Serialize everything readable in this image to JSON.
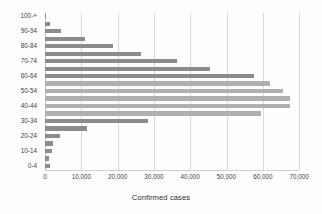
{
  "chart_data": {
    "type": "bar",
    "orientation": "horizontal",
    "title": "",
    "xlabel": "Confirmed cases",
    "ylabel": "",
    "xlim": [
      0,
      70000
    ],
    "ylim": null,
    "grid": true,
    "legend": null,
    "xticks": [
      0,
      10000,
      20000,
      30000,
      40000,
      50000,
      60000,
      70000
    ],
    "xticklabels": [
      "0",
      "10,000",
      "20,000",
      "30,000",
      "40,000",
      "50,000",
      "60,000",
      "70,000"
    ],
    "categories": [
      "100-+",
      "95-99",
      "90-94",
      "85-89",
      "80-84",
      "75-79",
      "70-74",
      "65-69",
      "60-64",
      "55-59",
      "50-54",
      "45-49",
      "40-44",
      "35-39",
      "30-34",
      "25-29",
      "20-24",
      "15-19",
      "10-14",
      "5-9",
      "0-4"
    ],
    "visible_yticklabels": [
      "100-+",
      "90-94",
      "80-84",
      "70-74",
      "60-64",
      "50-54",
      "40-44",
      "30-34",
      "20-24",
      "10-14",
      "0-4"
    ],
    "values": [
      300,
      1500,
      4300,
      11000,
      18800,
      26500,
      36500,
      45500,
      57500,
      62000,
      65500,
      67500,
      67500,
      59500,
      28500,
      11500,
      4200,
      2200,
      1800,
      1100,
      1500
    ],
    "colors": {
      "bar_dark": "#8c8c8c",
      "bar_light": "#b0b0b0",
      "gridline": "#d9d9d9",
      "axis": "#bdbdbd",
      "text": "#3f3f3f",
      "background": "#ffffff"
    }
  }
}
